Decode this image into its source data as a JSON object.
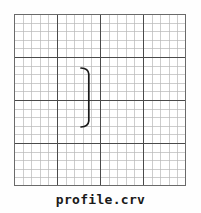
{
  "document": {
    "title": "profile.crv",
    "caption": "profile.crv",
    "background_color": "#fefefe"
  },
  "grid": {
    "origin_x": 14,
    "origin_y": 14,
    "width": 172,
    "height": 172,
    "cells_x": 20,
    "cells_y": 20,
    "cell_size": 8.6,
    "major_every": 5,
    "minor_color": "#b8b8b8",
    "major_color": "#4a4a4a",
    "border_color": "#6a6a6a",
    "background_color": "#ffffff",
    "minor_width": 0.7,
    "major_width": 1.3
  },
  "chart_data": {
    "type": "line",
    "title": "profile.crv",
    "xlabel": "",
    "ylabel": "",
    "grid": true,
    "legend": null,
    "xlim": [
      0,
      20
    ],
    "ylim": [
      0,
      20
    ],
    "series": [
      {
        "name": "profile",
        "color": "#1a1a1a",
        "linewidth": 1.6,
        "shape": "bracket-right",
        "description": "Vertical profile line with short hooks curving left at both ends, forming a ']' bracket",
        "x": [
          9.4,
          9.8,
          10.0,
          10.0,
          10.0,
          10.0,
          10.0,
          9.8,
          9.4
        ],
        "y": [
          7.0,
          7.1,
          7.5,
          9.0,
          10.5,
          12.0,
          13.0,
          13.4,
          13.5
        ]
      }
    ],
    "annotations": []
  },
  "curve_path": {
    "path_d": "M 67 54 C 72 54.2 74.5 56.5 74.8 60 L 74.8 107 C 74.5 110.5 72 112.8 67 113",
    "stroke": "#1a1a1a",
    "stroke_width": 1.7
  }
}
